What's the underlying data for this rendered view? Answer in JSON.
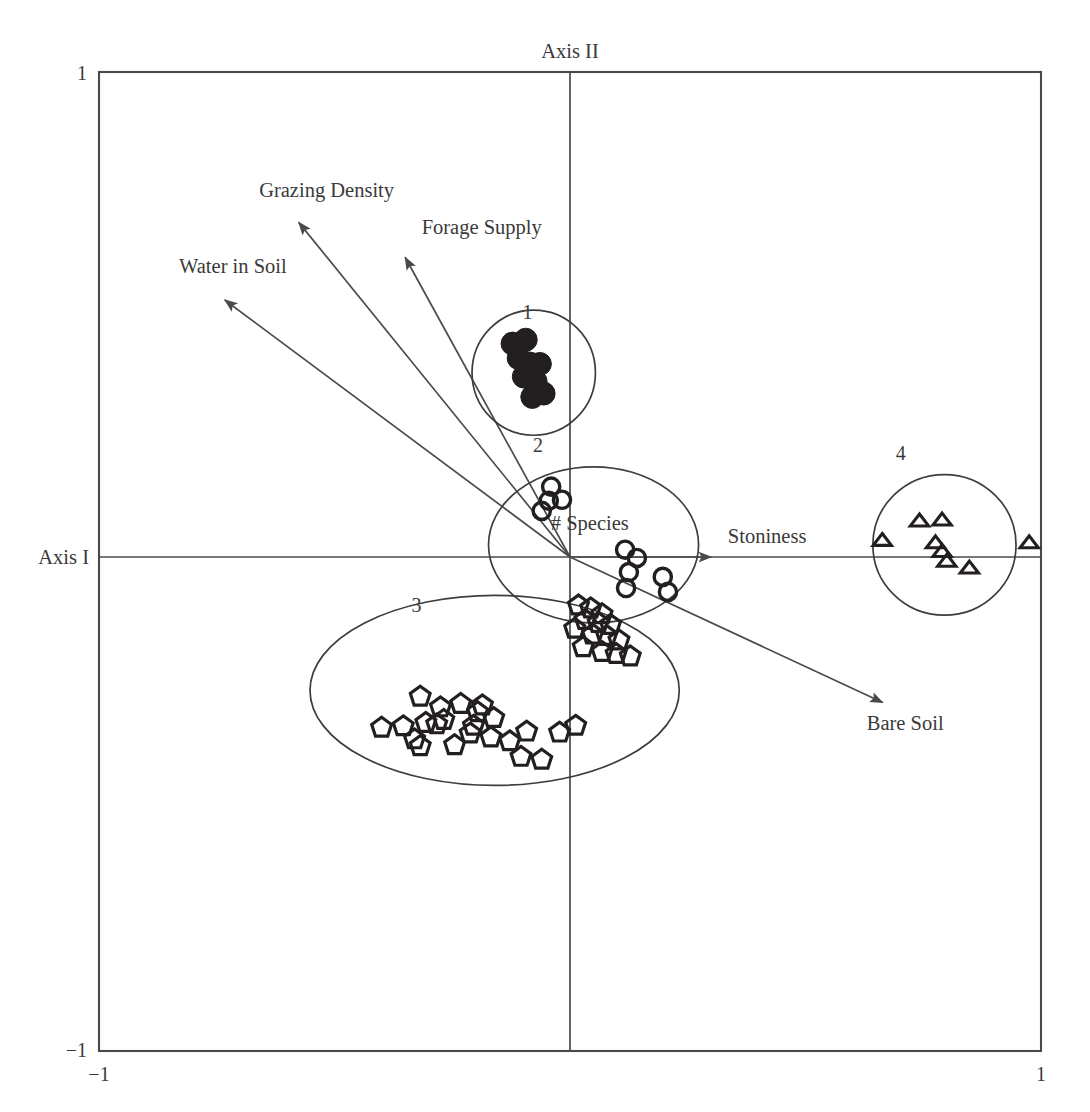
{
  "figure": {
    "kind": "ordination-biplot"
  },
  "chart_data": {
    "type": "scatter",
    "title": "",
    "subtitle": "",
    "xlabel": "Axis I",
    "ylabel": "Axis II",
    "xlim": [
      -1,
      1
    ],
    "ylim": [
      -1,
      1
    ],
    "grid": false,
    "legend": "none",
    "axis_labels": {
      "x_axis_name": "Axis I",
      "y_axis_name": "Axis II"
    },
    "tick_labels": {
      "y_top": "1",
      "y_bottom": "−1",
      "x_left": "−1",
      "x_right": "1"
    },
    "environmental_vectors": [
      {
        "name": "Grazing Density",
        "x": -0.576,
        "y": 0.69,
        "label_x": -0.64,
        "label_y": 0.74
      },
      {
        "name": "Forage Supply",
        "x": -0.35,
        "y": 0.618,
        "label_x": -0.3,
        "label_y": 0.665
      },
      {
        "name": "Water in Soil",
        "x": -0.733,
        "y": 0.53,
        "label_x": -0.81,
        "label_y": 0.585
      },
      {
        "name": "Stoniness",
        "x": 0.3,
        "y": 0.0,
        "label_x": 0.345,
        "label_y": 0.05
      },
      {
        "name": "Bare Soil",
        "x": 0.664,
        "y": -0.3,
        "label_x": 0.64,
        "label_y": -0.348
      }
    ],
    "centroid_label": {
      "name": "# Species",
      "x": 0.042,
      "y": 0.055
    },
    "groups": [
      {
        "id": "1",
        "label": "1",
        "marker": "filled-circle",
        "label_x": -0.09,
        "label_y": 0.49,
        "hull": {
          "cx": -0.077,
          "cy": 0.38,
          "rx": 0.131,
          "ry": 0.129
        },
        "n": 9,
        "points": [
          [
            -0.122,
            0.44
          ],
          [
            -0.094,
            0.448
          ],
          [
            -0.109,
            0.41
          ],
          [
            -0.086,
            0.399
          ],
          [
            -0.064,
            0.398
          ],
          [
            -0.098,
            0.372
          ],
          [
            -0.073,
            0.362
          ],
          [
            -0.08,
            0.33
          ],
          [
            -0.056,
            0.337
          ]
        ]
      },
      {
        "id": "2",
        "label": "2",
        "marker": "open-circle",
        "label_x": -0.068,
        "label_y": 0.216,
        "hull": {
          "cx": 0.05,
          "cy": 0.025,
          "rx": 0.223,
          "ry": 0.161
        },
        "n": 10,
        "points": [
          [
            -0.04,
            0.145
          ],
          [
            -0.045,
            0.116
          ],
          [
            -0.017,
            0.118
          ],
          [
            -0.06,
            0.095
          ],
          [
            0.117,
            0.015
          ],
          [
            0.142,
            -0.002
          ],
          [
            0.125,
            -0.031
          ],
          [
            0.119,
            -0.064
          ],
          [
            0.197,
            -0.041
          ],
          [
            0.208,
            -0.072
          ]
        ]
      },
      {
        "id": "3",
        "label": "3",
        "marker": "open-pentagon",
        "label_x": -0.326,
        "label_y": -0.113,
        "hull": {
          "cx": -0.16,
          "cy": -0.275,
          "rx": 0.392,
          "ry": 0.196
        },
        "n": 36,
        "points": [
          [
            0.018,
            -0.1
          ],
          [
            0.044,
            -0.106
          ],
          [
            0.068,
            -0.118
          ],
          [
            0.032,
            -0.13
          ],
          [
            0.06,
            -0.136
          ],
          [
            0.086,
            -0.14
          ],
          [
            0.01,
            -0.148
          ],
          [
            0.048,
            -0.16
          ],
          [
            0.078,
            -0.163
          ],
          [
            0.104,
            -0.172
          ],
          [
            0.028,
            -0.186
          ],
          [
            0.068,
            -0.196
          ],
          [
            0.098,
            -0.2
          ],
          [
            0.128,
            -0.205
          ],
          [
            -0.318,
            -0.288
          ],
          [
            -0.275,
            -0.31
          ],
          [
            -0.232,
            -0.303
          ],
          [
            -0.4,
            -0.352
          ],
          [
            -0.354,
            -0.349
          ],
          [
            -0.306,
            -0.342
          ],
          [
            -0.33,
            -0.376
          ],
          [
            -0.318,
            -0.39
          ],
          [
            -0.283,
            -0.345
          ],
          [
            -0.268,
            -0.336
          ],
          [
            -0.196,
            -0.32
          ],
          [
            -0.186,
            -0.306
          ],
          [
            -0.205,
            -0.348
          ],
          [
            -0.212,
            -0.364
          ],
          [
            -0.162,
            -0.332
          ],
          [
            -0.168,
            -0.372
          ],
          [
            -0.245,
            -0.388
          ],
          [
            -0.128,
            -0.38
          ],
          [
            -0.092,
            -0.36
          ],
          [
            -0.104,
            -0.412
          ],
          [
            -0.06,
            -0.418
          ],
          [
            -0.022,
            -0.362
          ],
          [
            0.012,
            -0.348
          ]
        ]
      },
      {
        "id": "4",
        "label": "4",
        "marker": "open-triangle",
        "label_x": 0.702,
        "label_y": 0.2,
        "hull": {
          "cx": 0.795,
          "cy": 0.025,
          "rx": 0.152,
          "ry": 0.145
        },
        "n": 8,
        "points": [
          [
            0.742,
            0.075
          ],
          [
            0.79,
            0.077
          ],
          [
            0.663,
            0.035
          ],
          [
            0.776,
            0.03
          ],
          [
            0.79,
            0.012
          ],
          [
            0.8,
            -0.008
          ],
          [
            0.848,
            -0.022
          ],
          [
            0.975,
            0.03
          ]
        ]
      }
    ]
  }
}
